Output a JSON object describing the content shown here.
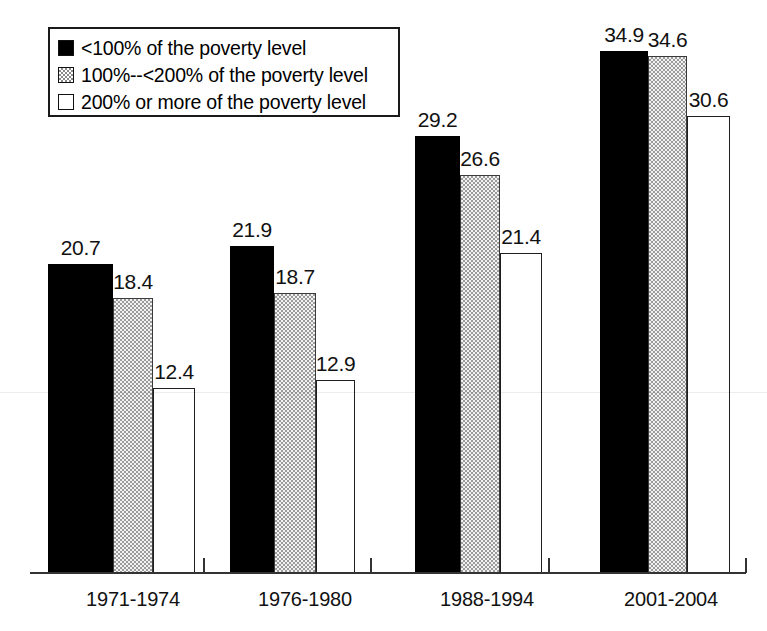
{
  "legend": {
    "position": "inside-top-left",
    "items": [
      {
        "label": "<100% of the poverty level",
        "swatch": "black-filled-square-icon",
        "color": "#000000"
      },
      {
        "label": "100%--<200% of the poverty level",
        "swatch": "dotted-pattern-square-icon",
        "color": "#9b9b9b"
      },
      {
        "label": "200% or more of the poverty level",
        "swatch": "white-outlined-square-icon",
        "color": "#ffffff"
      }
    ]
  },
  "chart_data": {
    "type": "bar",
    "title": "",
    "xlabel": "",
    "ylabel": "",
    "ylim": [
      0,
      40
    ],
    "grid": false,
    "legend_position": "top-left-inside",
    "categories": [
      "1971-1974",
      "1976-1980",
      "1988-1994",
      "2001-2004"
    ],
    "series": [
      {
        "name": "<100% of the poverty level",
        "values": [
          20.7,
          21.9,
          29.2,
          34.9
        ]
      },
      {
        "name": "100%--<200% of the poverty level",
        "values": [
          18.4,
          18.7,
          26.6,
          34.6
        ]
      },
      {
        "name": "200% or more of the poverty level",
        "values": [
          12.4,
          12.9,
          21.4,
          30.6
        ]
      }
    ],
    "data_labels": [
      [
        "20.7",
        "18.4",
        "12.4"
      ],
      [
        "21.9",
        "18.7",
        "12.9"
      ],
      [
        "29.2",
        "26.6",
        "21.4"
      ],
      [
        "34.9",
        "34.6",
        "30.6"
      ]
    ]
  },
  "axis": {
    "ticks": [
      "",
      "",
      "",
      "",
      ""
    ]
  }
}
